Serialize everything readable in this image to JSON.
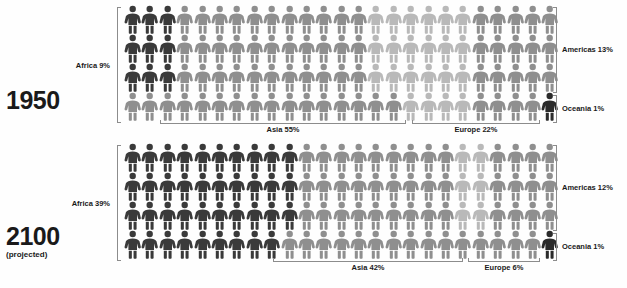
{
  "chart_data": {
    "type": "pictogram",
    "unit": "1 figure = 1% of world population",
    "grid": {
      "columns": 25,
      "rows": 4,
      "total_figures": 100
    },
    "colors": {
      "africa": "#3a3a3a",
      "asia": "#8f8f8f",
      "europe": "#b9b9b9",
      "americas": "#8f8f8f",
      "oceania": "#2b2b2b",
      "bracket": "#8c8c8c",
      "text": "#1a1a1a",
      "background": "#fefefe"
    },
    "panels": [
      {
        "id": "1950",
        "year_label": "1950",
        "year_sublabel": "",
        "series": [
          {
            "name": "Africa",
            "label": "Africa 9%",
            "value": 9,
            "color": "#3a3a3a"
          },
          {
            "name": "Asia",
            "label": "Asia 55%",
            "value": 55,
            "color": "#8f8f8f"
          },
          {
            "name": "Europe",
            "label": "Europe 22%",
            "value": 22,
            "color": "#b9b9b9"
          },
          {
            "name": "Americas",
            "label": "Americas 13%",
            "value": 13,
            "color": "#8f8f8f"
          },
          {
            "name": "Oceania",
            "label": "Oceania 1%",
            "value": 1,
            "color": "#2b2b2b"
          }
        ]
      },
      {
        "id": "2100",
        "year_label": "2100",
        "year_sublabel": "(projected)",
        "series": [
          {
            "name": "Africa",
            "label": "Africa 39%",
            "value": 39,
            "color": "#3a3a3a"
          },
          {
            "name": "Asia",
            "label": "Asia 42%",
            "value": 42,
            "color": "#8f8f8f"
          },
          {
            "name": "Europe",
            "label": "Europe 6%",
            "value": 6,
            "color": "#b9b9b9"
          },
          {
            "name": "Americas",
            "label": "Americas 12%",
            "value": 12,
            "color": "#8f8f8f"
          },
          {
            "name": "Oceania",
            "label": "Oceania 1%",
            "value": 1,
            "color": "#2b2b2b"
          }
        ]
      }
    ]
  }
}
